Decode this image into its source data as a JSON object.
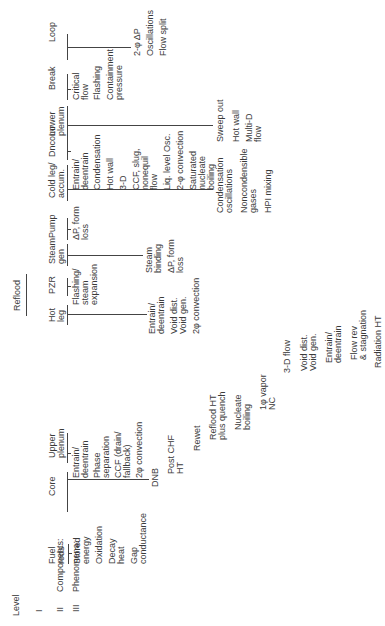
{
  "levels": {
    "heading": "Level",
    "level_1": "I",
    "level_2_numeral": "II",
    "level_2_label": "Components:",
    "level_3_numeral": "III",
    "level_3_label": "Phenomena:"
  },
  "phase_label": "Reflood",
  "components": [
    {
      "name": "Fuel\nrods",
      "phenomena": [
        "Stored\nenergy",
        "Oxidation",
        "Decay\nheat",
        "Gap\nconductance"
      ]
    },
    {
      "name": "Core",
      "phenomena": [
        "DNB",
        "Post CHF\nHT",
        "Rewet",
        "Reflood HT\nplus quench",
        "Nucleate\nboiling",
        "1φ vapor\nNC",
        "3-D flow",
        "Void dist.\nVoid gen.",
        "Entrain/\ndeentrain",
        "Flow rev\n& stagnation",
        "Radiation HT"
      ]
    },
    {
      "name": "Upper\nplenum",
      "phenomena": [
        "Entrain/\ndeentrain",
        "Phase\nseparation",
        "CCF (drain/\nfallback)",
        "2φ convection"
      ]
    },
    {
      "name": "Hot\nleg",
      "phenomena": [
        "Entrain/\ndeentrain",
        "Void dist.\nVoid gen.",
        "2φ convection"
      ]
    },
    {
      "name": "PZR",
      "phenomena": [
        "Flashing/\nsteam\nexpansion"
      ]
    },
    {
      "name": "Steam\ngen",
      "phenomena": [
        "Steam\nbinding",
        "ΔP, form\nloss"
      ]
    },
    {
      "name": "Pump",
      "phenomena": [
        "ΔP, form\nloss"
      ]
    },
    {
      "name": "Cold leg/\naccum.",
      "phenomena": [
        "Condensation\noscillations",
        "Noncondensible\ngases",
        "HPI mixing"
      ]
    },
    {
      "name": "Dncomr",
      "phenomena": [
        "Entrain/\ndeentrain",
        "Condensation",
        "Hot wall",
        "3-D",
        "CCF, slug,\nnonequil\nflow",
        "Liq. level Osc.",
        "2-φ convection",
        "Saturated\nnucleate\nboiling"
      ]
    },
    {
      "name": "Lower\nplenum",
      "phenomena": [
        "Sweep out",
        "Hot wall",
        "Multi-D\nflow"
      ]
    },
    {
      "name": "Break",
      "phenomena": [
        "Critical\nflow",
        "Flashing",
        "Containment\npressure"
      ]
    },
    {
      "name": "Loop",
      "phenomena": [
        "2-φ ΔP",
        "Oscillations",
        "Flow split"
      ]
    }
  ]
}
